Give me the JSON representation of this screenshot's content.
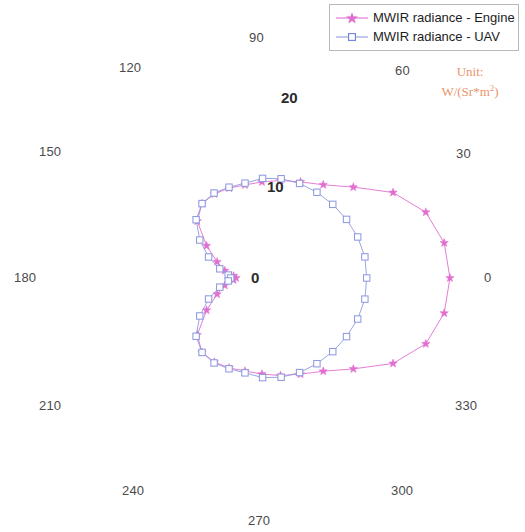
{
  "legend": {
    "items": [
      {
        "label": "MWIR radiance - Engine",
        "color": "#e06fd0",
        "marker": "star-marker"
      },
      {
        "label": "MWIR radiance - UAV",
        "color": "#8f9ae0",
        "marker": "square-marker"
      }
    ]
  },
  "unit": {
    "line1": "Unit:",
    "line2_prefix": "W/(Sr*m",
    "line2_sup": "2",
    "line2_suffix": ")",
    "color": "#e8956b"
  },
  "angular_labels": [
    {
      "text": "0",
      "x": 484,
      "y": 270
    },
    {
      "text": "30",
      "x": 456,
      "y": 146
    },
    {
      "text": "60",
      "x": 395,
      "y": 63
    },
    {
      "text": "90",
      "x": 249,
      "y": 30
    },
    {
      "text": "120",
      "x": 119,
      "y": 60
    },
    {
      "text": "150",
      "x": 39,
      "y": 144
    },
    {
      "text": "180",
      "x": 14,
      "y": 270
    },
    {
      "text": "210",
      "x": 39,
      "y": 398
    },
    {
      "text": "240",
      "x": 122,
      "y": 483
    },
    {
      "text": "270",
      "x": 248,
      "y": 513
    },
    {
      "text": "300",
      "x": 391,
      "y": 483
    },
    {
      "text": "330",
      "x": 455,
      "y": 398
    }
  ],
  "radial_labels": [
    {
      "text": "0",
      "x": 251,
      "y": 269
    },
    {
      "text": "10",
      "x": 267,
      "y": 178
    },
    {
      "text": "20",
      "x": 281,
      "y": 89
    }
  ],
  "chart_data": {
    "type": "line",
    "plot_style": "polar",
    "title": "",
    "xlabel": "",
    "ylabel": "",
    "unit": "W/(Sr*m^2)",
    "angle_unit": "degrees",
    "angle_ticks": [
      0,
      30,
      60,
      90,
      120,
      150,
      180,
      210,
      240,
      270,
      300,
      330
    ],
    "radial_ticks": [
      0,
      10,
      20
    ],
    "rlim": [
      0,
      20
    ],
    "grid": false,
    "legend_position": "top-right",
    "series": [
      {
        "name": "MWIR radiance - Engine",
        "color": "#e06fd0",
        "marker": "star",
        "theta": [
          0,
          10,
          20,
          30,
          40,
          50,
          60,
          70,
          80,
          90,
          100,
          110,
          120,
          130,
          140,
          150,
          160,
          170,
          180,
          190,
          200,
          210,
          220,
          230,
          240,
          250,
          260,
          270,
          280,
          290,
          300,
          310,
          320,
          330,
          340,
          350
        ],
        "r": [
          22.9,
          22.6,
          21.5,
          19.1,
          15.8,
          13.6,
          12.4,
          11.6,
          10.9,
          10.4,
          10.2,
          10.0,
          9.6,
          8.3,
          5.6,
          3.6,
          2.4,
          1.3,
          1.0,
          1.3,
          2.4,
          3.6,
          5.6,
          8.3,
          9.6,
          10.0,
          10.2,
          10.4,
          10.9,
          11.6,
          12.4,
          13.6,
          15.8,
          19.1,
          21.5,
          22.6
        ]
      },
      {
        "name": "MWIR radiance - UAV",
        "color": "#8f9ae0",
        "marker": "square",
        "theta": [
          0,
          10,
          20,
          30,
          40,
          50,
          60,
          70,
          80,
          90,
          100,
          110,
          120,
          130,
          140,
          150,
          160,
          170,
          180,
          190,
          200,
          210,
          220,
          230,
          240,
          250,
          260,
          270,
          280,
          290,
          300,
          310,
          320,
          330,
          340,
          350
        ],
        "r": [
          13.6,
          13.6,
          13.4,
          13.1,
          12.8,
          12.5,
          12.2,
          11.8,
          11.3,
          10.6,
          10.3,
          10.1,
          9.6,
          8.5,
          6.6,
          4.7,
          3.0,
          1.9,
          1.6,
          1.9,
          3.0,
          4.7,
          6.6,
          8.5,
          9.6,
          10.1,
          10.3,
          10.6,
          11.3,
          11.8,
          12.2,
          12.5,
          12.8,
          13.1,
          13.4,
          13.6
        ]
      }
    ],
    "geometry": {
      "center_x": 245,
      "center_y": 278,
      "pixels_per_unit": 8.95,
      "theta_zero_at": "east",
      "theta_direction": "counterclockwise"
    }
  }
}
